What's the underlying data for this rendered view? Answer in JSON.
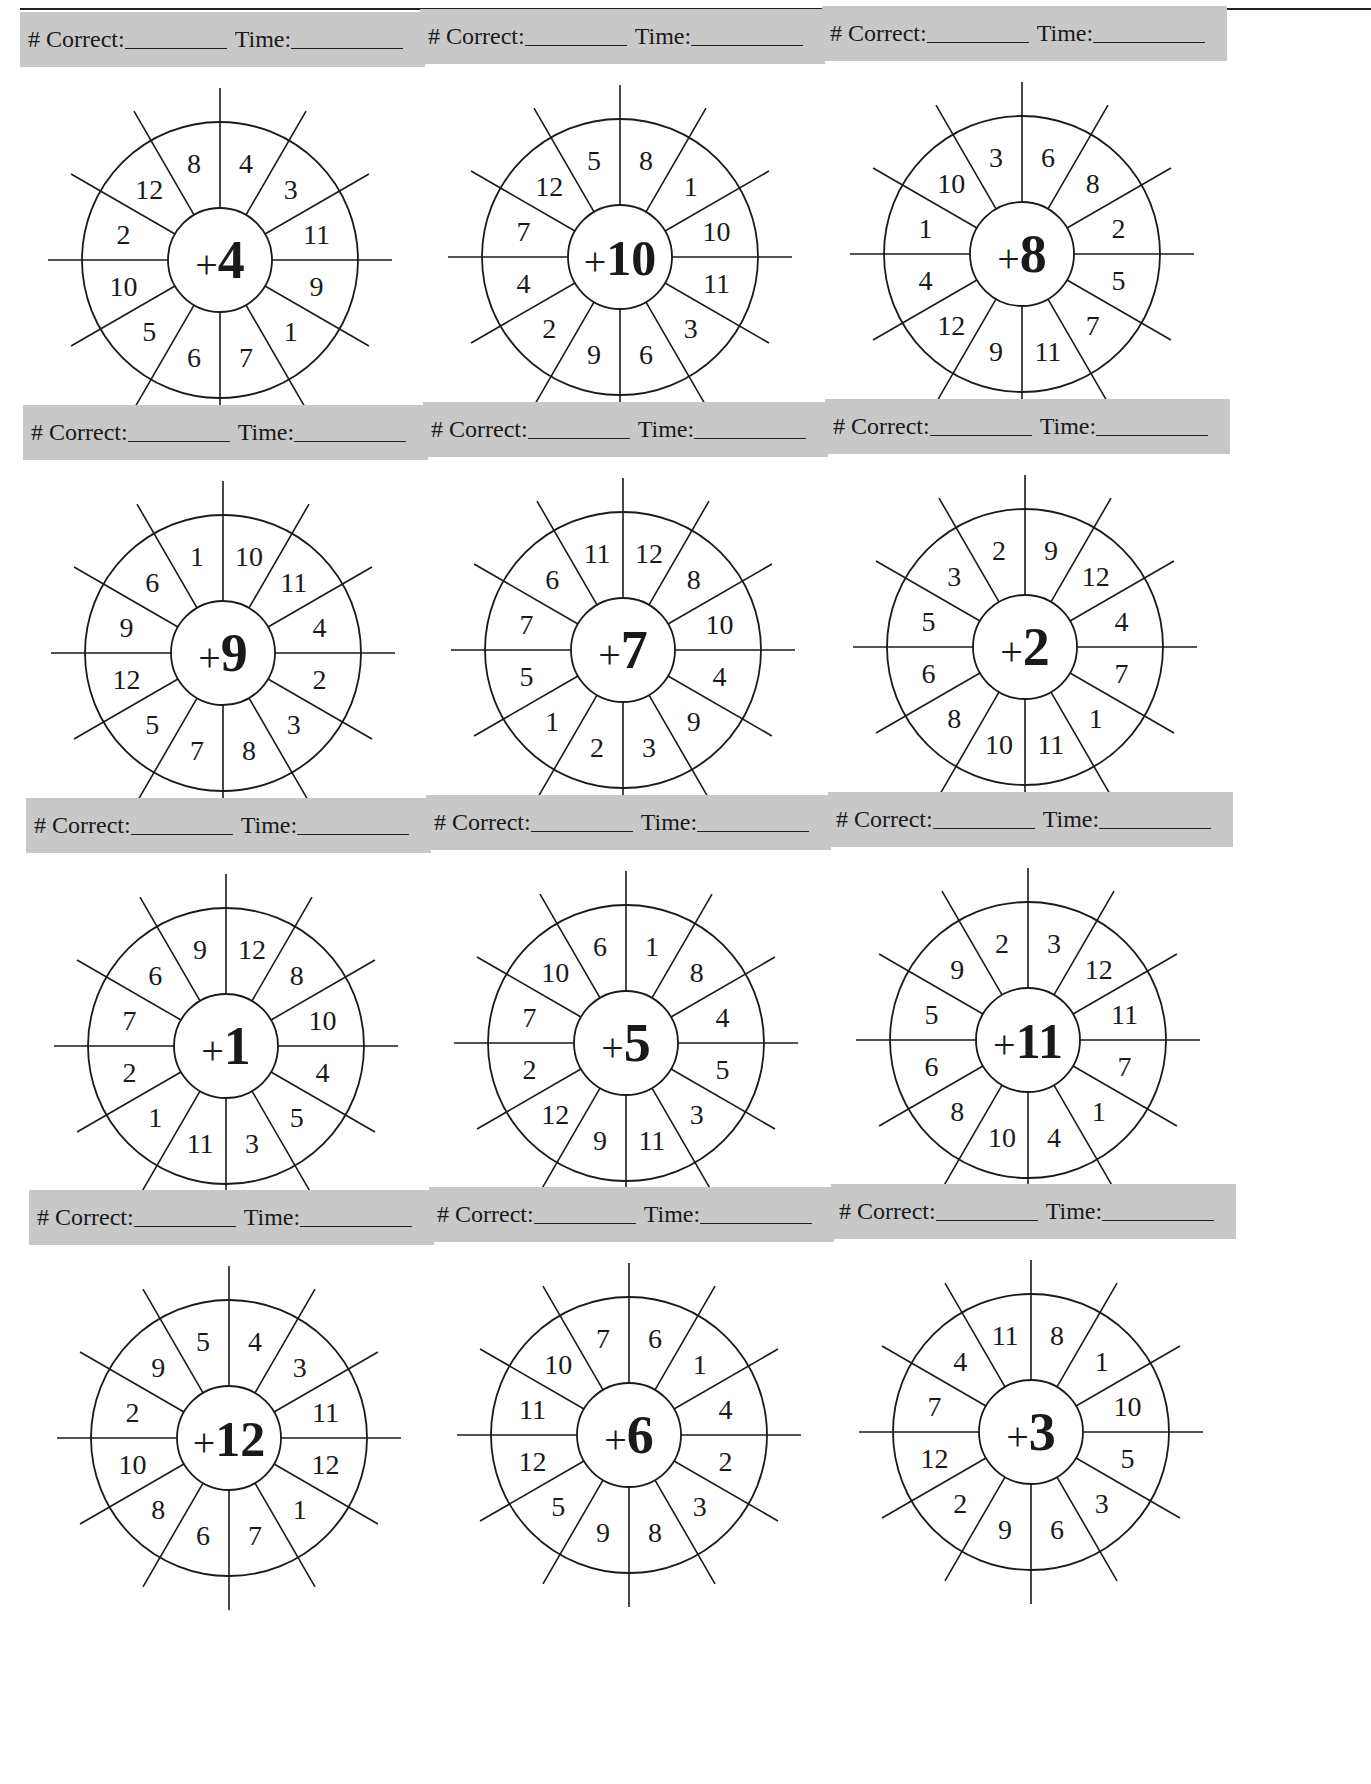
{
  "page": {
    "page_number_fragment": "32",
    "score_labels": {
      "correct": "# Correct:",
      "time": "Time:"
    }
  },
  "wheels": [
    {
      "addend": "+4",
      "prefix": "+",
      "value": "4",
      "numbers": [
        "4",
        "3",
        "11",
        "9",
        "1",
        "7",
        "6",
        "5",
        "10",
        "2",
        "12",
        "8"
      ]
    },
    {
      "addend": "+10",
      "prefix": "+",
      "value": "10",
      "numbers": [
        "8",
        "1",
        "10",
        "11",
        "3",
        "6",
        "9",
        "2",
        "4",
        "7",
        "12",
        "5"
      ]
    },
    {
      "addend": "+8",
      "prefix": "+",
      "value": "8",
      "numbers": [
        "6",
        "8",
        "2",
        "5",
        "7",
        "11",
        "9",
        "12",
        "4",
        "1",
        "10",
        "3"
      ]
    },
    {
      "addend": "+9",
      "prefix": "+",
      "value": "9",
      "numbers": [
        "10",
        "11",
        "4",
        "2",
        "3",
        "8",
        "7",
        "5",
        "12",
        "9",
        "6",
        "1"
      ]
    },
    {
      "addend": "+7",
      "prefix": "+",
      "value": "7",
      "numbers": [
        "12",
        "8",
        "10",
        "4",
        "9",
        "3",
        "2",
        "1",
        "5",
        "7",
        "6",
        "11"
      ]
    },
    {
      "addend": "+2",
      "prefix": "+",
      "value": "2",
      "numbers": [
        "9",
        "12",
        "4",
        "7",
        "1",
        "11",
        "10",
        "8",
        "6",
        "5",
        "3",
        "2"
      ]
    },
    {
      "addend": "+1",
      "prefix": "+",
      "value": "1",
      "numbers": [
        "12",
        "8",
        "10",
        "4",
        "5",
        "3",
        "11",
        "1",
        "2",
        "7",
        "6",
        "9"
      ]
    },
    {
      "addend": "+5",
      "prefix": "+",
      "value": "5",
      "numbers": [
        "1",
        "8",
        "4",
        "5",
        "3",
        "11",
        "9",
        "12",
        "2",
        "7",
        "10",
        "6"
      ]
    },
    {
      "addend": "+11",
      "prefix": "+",
      "value": "11",
      "numbers": [
        "3",
        "12",
        "11",
        "7",
        "1",
        "4",
        "10",
        "8",
        "6",
        "5",
        "9",
        "2"
      ]
    },
    {
      "addend": "+12",
      "prefix": "+",
      "value": "12",
      "numbers": [
        "4",
        "3",
        "11",
        "12",
        "1",
        "7",
        "6",
        "8",
        "10",
        "2",
        "9",
        "5"
      ]
    },
    {
      "addend": "+6",
      "prefix": "+",
      "value": "6",
      "numbers": [
        "6",
        "1",
        "4",
        "2",
        "3",
        "8",
        "9",
        "5",
        "12",
        "11",
        "10",
        "7"
      ]
    },
    {
      "addend": "+3",
      "prefix": "+",
      "value": "3",
      "numbers": [
        "8",
        "1",
        "10",
        "5",
        "3",
        "6",
        "9",
        "2",
        "12",
        "7",
        "4",
        "11"
      ]
    }
  ],
  "colors": {
    "score_bar_bg": "#c8c8c8",
    "ink": "#1a1a1a"
  }
}
